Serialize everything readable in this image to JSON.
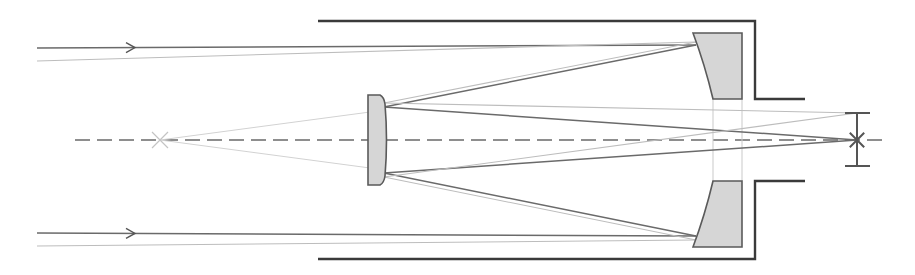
{
  "diagram": {
    "width": 915,
    "height": 275,
    "colors": {
      "background": "#ffffff",
      "tube": "#3a3a3a",
      "glass_fill": "#d6d6d6",
      "glass_stroke": "#5a5a5a",
      "ray_dark": "#6a6a6a",
      "ray_light": "#bdbdbd",
      "axis": "#6a6a6a"
    },
    "optical_axis": {
      "x1": 75,
      "y": 140,
      "x2": 882
    },
    "tube": {
      "top_path": "M318,21 L755,21 L755,99 L805,99",
      "bottom_path": "M318,259 L755,259 L755,181 L805,181"
    },
    "primary_mirror": {
      "label": "primary-mirror",
      "top_segment": "M693,33 L742,33 L742,99 L713,99 Q705,65 693,33 Z",
      "bottom_segment": "M713,181 L742,181 L742,247 L693,247 Q705,215 713,181 Z",
      "hole_guides": [
        {
          "x1": 713,
          "y1": 99,
          "x2": 713,
          "y2": 181
        },
        {
          "x1": 742,
          "y1": 99,
          "x2": 742,
          "y2": 181
        }
      ]
    },
    "secondary_mirror": {
      "label": "secondary-corrector",
      "path": "M368,95 L380,95 Q384,97 385,104 Q388,140 385,176 Q384,183 380,185 L368,185 Z"
    },
    "incoming_rays": [
      {
        "kind": "dark",
        "x1": 37,
        "y1": 48,
        "x2": 696,
        "y2": 45,
        "arrow_x": 135
      },
      {
        "kind": "light",
        "x1": 37,
        "y1": 61,
        "x2": 696,
        "y2": 42
      },
      {
        "kind": "dark",
        "x1": 37,
        "y1": 233,
        "x2": 696,
        "y2": 236,
        "arrow_x": 135
      },
      {
        "kind": "light",
        "x1": 37,
        "y1": 246,
        "x2": 696,
        "y2": 240
      }
    ],
    "reflected_rays": [
      {
        "kind": "dark",
        "x1": 696,
        "y1": 45,
        "x2": 384,
        "y2": 107
      },
      {
        "kind": "light",
        "x1": 696,
        "y1": 42,
        "x2": 384,
        "y2": 103
      },
      {
        "kind": "dark",
        "x1": 696,
        "y1": 236,
        "x2": 384,
        "y2": 173
      },
      {
        "kind": "light",
        "x1": 696,
        "y1": 240,
        "x2": 384,
        "y2": 177
      }
    ],
    "secondary_to_focus_rays": [
      {
        "kind": "dark",
        "x1": 384,
        "y1": 107,
        "x2": 857,
        "y2": 140
      },
      {
        "kind": "light",
        "x1": 384,
        "y1": 103,
        "x2": 857,
        "y2": 113
      },
      {
        "kind": "dark",
        "x1": 384,
        "y1": 173,
        "x2": 857,
        "y2": 140
      },
      {
        "kind": "light",
        "x1": 384,
        "y1": 177,
        "x2": 857,
        "y2": 113
      }
    ],
    "virtual_rays": [
      {
        "x1": 160,
        "y1": 140,
        "x2": 370,
        "y2": 112
      },
      {
        "x1": 160,
        "y1": 140,
        "x2": 370,
        "y2": 168
      }
    ],
    "virtual_focus": {
      "label": "virtual-focus",
      "x": 160,
      "y": 140,
      "size": 8
    },
    "focal_marker": {
      "label": "focal-plane",
      "x": 857,
      "y_top": 113,
      "y_bottom": 166,
      "cap_x1": 845,
      "cap_x2": 870,
      "star_x": 857,
      "star_y": 140,
      "star_r": 10
    }
  }
}
